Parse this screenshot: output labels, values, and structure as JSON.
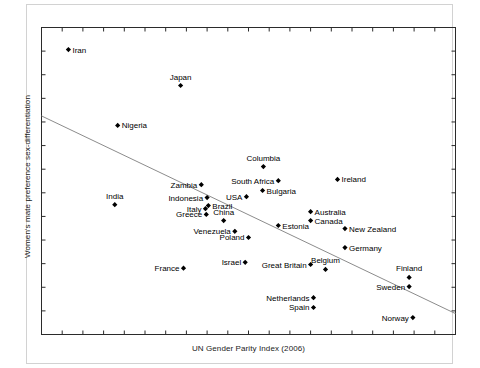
{
  "chart_data": {
    "type": "scatter",
    "title": "",
    "xlabel": "UN Gender Parity Index (2006)",
    "ylabel": "Women's mate preference sex-differentiation",
    "grid": false,
    "legend": false,
    "axis_tick_labels": false,
    "xlim": [
      0,
      1
    ],
    "ylim": [
      0,
      1
    ],
    "trendline": {
      "x0": 0.0,
      "y0": 0.712,
      "x1": 1.0,
      "y1": 0.068
    },
    "points": [
      {
        "label": "Iran",
        "x": 0.065,
        "y": 0.928,
        "lp": "r"
      },
      {
        "label": "Japan",
        "x": 0.336,
        "y": 0.811,
        "lp": "t"
      },
      {
        "label": "Nigeria",
        "x": 0.184,
        "y": 0.681,
        "lp": "r"
      },
      {
        "label": "Columbia",
        "x": 0.536,
        "y": 0.547,
        "lp": "t"
      },
      {
        "label": "South Africa",
        "x": 0.572,
        "y": 0.501,
        "lp": "l"
      },
      {
        "label": "Ireland",
        "x": 0.715,
        "y": 0.505,
        "lp": "r"
      },
      {
        "label": "Zambia",
        "x": 0.386,
        "y": 0.488,
        "lp": "l"
      },
      {
        "label": "Bulgaria",
        "x": 0.534,
        "y": 0.469,
        "lp": "r"
      },
      {
        "label": "USA",
        "x": 0.495,
        "y": 0.449,
        "lp": "l"
      },
      {
        "label": "India",
        "x": 0.177,
        "y": 0.423,
        "lp": "t"
      },
      {
        "label": "Indonesia",
        "x": 0.4,
        "y": 0.446,
        "lp": "l"
      },
      {
        "label": "Brazil",
        "x": 0.403,
        "y": 0.42,
        "lp": "r"
      },
      {
        "label": "Italy",
        "x": 0.396,
        "y": 0.41,
        "lp": "l"
      },
      {
        "label": "Australia",
        "x": 0.65,
        "y": 0.4,
        "lp": "r"
      },
      {
        "label": "Greece",
        "x": 0.398,
        "y": 0.391,
        "lp": "l"
      },
      {
        "label": "China",
        "x": 0.44,
        "y": 0.371,
        "lp": "t"
      },
      {
        "label": "Canada",
        "x": 0.65,
        "y": 0.371,
        "lp": "r"
      },
      {
        "label": "New Zealand",
        "x": 0.733,
        "y": 0.345,
        "lp": "r"
      },
      {
        "label": "Venezuela",
        "x": 0.467,
        "y": 0.336,
        "lp": "l"
      },
      {
        "label": "Estonia",
        "x": 0.572,
        "y": 0.355,
        "lp": "r"
      },
      {
        "label": "Poland",
        "x": 0.5,
        "y": 0.316,
        "lp": "l"
      },
      {
        "label": "Germany",
        "x": 0.733,
        "y": 0.283,
        "lp": "r"
      },
      {
        "label": "Israel",
        "x": 0.492,
        "y": 0.235,
        "lp": "l"
      },
      {
        "label": "France",
        "x": 0.343,
        "y": 0.216,
        "lp": "l"
      },
      {
        "label": "Great Britain",
        "x": 0.65,
        "y": 0.228,
        "lp": "l"
      },
      {
        "label": "Belgium",
        "x": 0.686,
        "y": 0.212,
        "lp": "t"
      },
      {
        "label": "Finland",
        "x": 0.888,
        "y": 0.186,
        "lp": "t"
      },
      {
        "label": "Netherlands",
        "x": 0.657,
        "y": 0.12,
        "lp": "l"
      },
      {
        "label": "Sweden",
        "x": 0.888,
        "y": 0.156,
        "lp": "l"
      },
      {
        "label": "Spain",
        "x": 0.657,
        "y": 0.088,
        "lp": "l"
      },
      {
        "label": "Norway",
        "x": 0.897,
        "y": 0.055,
        "lp": "l"
      }
    ]
  }
}
